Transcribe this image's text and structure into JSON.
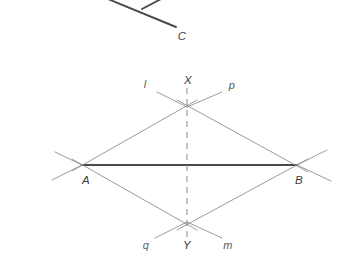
{
  "figure": {
    "background_color": "#ffffff",
    "construction_line_color": "#8a8a8a",
    "solid_segment_color": "#4a4a4a",
    "dashed_line_color": "#8a8a8a",
    "label_color": "#4f4f4f",
    "points": [
      {
        "name": "A",
        "label": "A",
        "x": 82,
        "y": 165,
        "label_x": 86,
        "label_y": 180
      },
      {
        "name": "B",
        "label": "B",
        "x": 297,
        "y": 165,
        "label_x": 299,
        "label_y": 180
      },
      {
        "name": "X",
        "label": "X",
        "x": 187,
        "y": 107,
        "label_x": 188,
        "label_y": 80
      },
      {
        "name": "Y",
        "label": "Y",
        "x": 187,
        "y": 222,
        "label_x": 187,
        "label_y": 245
      },
      {
        "name": "C",
        "label": "C",
        "x": 175,
        "y": 26,
        "label_x": 182,
        "label_y": 36
      }
    ],
    "line_labels": [
      {
        "name": "l",
        "label": "l",
        "x": 145,
        "y": 84
      },
      {
        "name": "p",
        "label": "p",
        "x": 232,
        "y": 85
      },
      {
        "name": "q",
        "label": "q",
        "x": 146,
        "y": 245
      },
      {
        "name": "m",
        "label": "m",
        "x": 228,
        "y": 245
      }
    ],
    "segments": [
      {
        "name": "segment-AB",
        "x1": 82,
        "y1": 165,
        "x2": 297,
        "y2": 165,
        "style": "solid-bold"
      },
      {
        "name": "arc-line-A-X",
        "x1": 72,
        "y1": 171,
        "x2": 197,
        "y2": 100,
        "style": "construction"
      },
      {
        "name": "arc-line-X-B",
        "x1": 177,
        "y1": 100,
        "x2": 308,
        "y2": 172,
        "style": "construction"
      },
      {
        "name": "arc-line-A-Y",
        "x1": 72,
        "y1": 159,
        "x2": 197,
        "y2": 230,
        "style": "construction"
      },
      {
        "name": "arc-line-Y-B",
        "x1": 177,
        "y1": 230,
        "x2": 308,
        "y2": 159,
        "style": "construction"
      },
      {
        "name": "arc-extension-upper-left-l",
        "x1": 157,
        "y1": 92,
        "x2": 187,
        "y2": 107,
        "style": "construction"
      },
      {
        "name": "arc-extension-upper-right-p",
        "x1": 222,
        "y1": 92,
        "x2": 187,
        "y2": 107,
        "style": "construction"
      },
      {
        "name": "arc-extension-lower-left-q",
        "x1": 155,
        "y1": 238,
        "x2": 187,
        "y2": 222,
        "style": "construction"
      },
      {
        "name": "arc-extension-lower-right-m",
        "x1": 222,
        "y1": 238,
        "x2": 187,
        "y2": 222,
        "style": "construction"
      },
      {
        "name": "arc-extension-left-of-A-upper",
        "x1": 55,
        "y1": 152,
        "x2": 82,
        "y2": 165,
        "style": "construction"
      },
      {
        "name": "arc-extension-left-of-A-lower",
        "x1": 52,
        "y1": 180,
        "x2": 82,
        "y2": 165,
        "style": "construction"
      },
      {
        "name": "arc-extension-right-of-B-upper",
        "x1": 297,
        "y1": 165,
        "x2": 327,
        "y2": 150,
        "style": "construction"
      },
      {
        "name": "arc-extension-right-of-B-lower",
        "x1": 297,
        "y1": 165,
        "x2": 331,
        "y2": 181,
        "style": "construction"
      },
      {
        "name": "top-fragment-main",
        "x1": 108,
        "y1": -1,
        "x2": 176,
        "y2": 27,
        "style": "solid-bold"
      },
      {
        "name": "top-fragment-branch",
        "x1": 142,
        "y1": 9,
        "x2": 161,
        "y2": -1,
        "style": "solid-bold"
      }
    ],
    "dashed_line": {
      "name": "perpendicular-bisector-XY",
      "x1": 187,
      "y1": 88,
      "x2": 187,
      "y2": 241,
      "dash_pattern": "6 5"
    }
  }
}
